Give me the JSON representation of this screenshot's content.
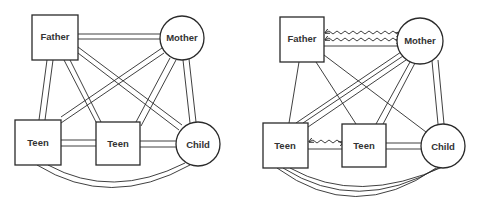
{
  "diagrams": [
    {
      "id": "left",
      "nodes": {
        "father": {
          "label": "Father",
          "shape": "square"
        },
        "mother": {
          "label": "Mother",
          "shape": "circle"
        },
        "teen1": {
          "label": "Teen",
          "shape": "square"
        },
        "teen2": {
          "label": "Teen",
          "shape": "square"
        },
        "child": {
          "label": "Child",
          "shape": "circle"
        }
      },
      "edges": [
        {
          "from": "father",
          "to": "mother",
          "type": "double"
        },
        {
          "from": "father",
          "to": "teen1",
          "type": "double"
        },
        {
          "from": "father",
          "to": "teen2",
          "type": "double"
        },
        {
          "from": "father",
          "to": "child",
          "type": "double"
        },
        {
          "from": "mother",
          "to": "teen1",
          "type": "double"
        },
        {
          "from": "mother",
          "to": "teen2",
          "type": "double"
        },
        {
          "from": "mother",
          "to": "child",
          "type": "double"
        },
        {
          "from": "teen1",
          "to": "teen2",
          "type": "double"
        },
        {
          "from": "teen2",
          "to": "child",
          "type": "double"
        },
        {
          "from": "teen1",
          "to": "child",
          "type": "double-arc"
        }
      ]
    },
    {
      "id": "right",
      "nodes": {
        "father": {
          "label": "Father",
          "shape": "square"
        },
        "mother": {
          "label": "Mother",
          "shape": "circle"
        },
        "teen1": {
          "label": "Teen",
          "shape": "square"
        },
        "teen2": {
          "label": "Teen",
          "shape": "square"
        },
        "child": {
          "label": "Child",
          "shape": "circle"
        }
      },
      "edges": [
        {
          "from": "father",
          "to": "mother",
          "type": "two-wavy-conflict-plus-single"
        },
        {
          "from": "father",
          "to": "teen1",
          "type": "single"
        },
        {
          "from": "father",
          "to": "teen2",
          "type": "single"
        },
        {
          "from": "father",
          "to": "child",
          "type": "single"
        },
        {
          "from": "mother",
          "to": "teen1",
          "type": "triple"
        },
        {
          "from": "mother",
          "to": "teen2",
          "type": "double"
        },
        {
          "from": "mother",
          "to": "child",
          "type": "double"
        },
        {
          "from": "teen1",
          "to": "teen2",
          "type": "wavy-conflict-plus-single"
        },
        {
          "from": "teen2",
          "to": "child",
          "type": "double"
        },
        {
          "from": "teen1",
          "to": "child",
          "type": "triple-arc"
        }
      ]
    }
  ]
}
